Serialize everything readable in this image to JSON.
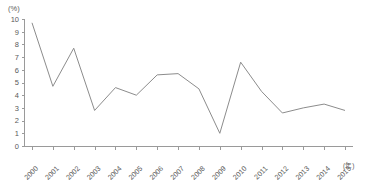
{
  "chart_data": {
    "type": "line",
    "title": "",
    "subtitle": "",
    "xlabel": "(年)",
    "ylabel": "(%)",
    "categories": [
      "2000",
      "2001",
      "2002",
      "2003",
      "2004",
      "2005",
      "2006",
      "2007",
      "2008",
      "2009",
      "2010",
      "2011",
      "2012",
      "2013",
      "2014",
      "2015"
    ],
    "x": [
      2000,
      2001,
      2002,
      2003,
      2004,
      2005,
      2006,
      2007,
      2008,
      2009,
      2010,
      2011,
      2012,
      2013,
      2014,
      2015
    ],
    "values": [
      9.7,
      4.7,
      7.7,
      2.8,
      4.6,
      4.0,
      5.6,
      5.7,
      4.5,
      1.0,
      6.6,
      4.3,
      2.6,
      3.0,
      3.3,
      2.8
    ],
    "series": [
      {
        "name": "",
        "values": [
          9.7,
          4.7,
          7.7,
          2.8,
          4.6,
          4.0,
          5.6,
          5.7,
          4.5,
          1.0,
          6.6,
          4.3,
          2.6,
          3.0,
          3.3,
          2.8
        ]
      }
    ],
    "ylim": [
      0,
      10
    ],
    "yticks": [
      0,
      1,
      2,
      3,
      4,
      5,
      6,
      7,
      8,
      9,
      10
    ],
    "ytick_labels": [
      "0",
      "1",
      "2",
      "3",
      "4",
      "5",
      "6",
      "7",
      "8",
      "9",
      "10"
    ],
    "xtick_labels": [
      "2000",
      "2001",
      "2002",
      "2003",
      "2004",
      "2005",
      "2006",
      "2007",
      "2008",
      "2009",
      "2010",
      "2011",
      "2012",
      "2013",
      "2014",
      "2015"
    ],
    "grid": false,
    "legend": "none",
    "line_color": "#8c8c8c",
    "axis_color": "#9a9a9a",
    "text_color": "#5a5a5a",
    "background_color": "#ffffff"
  }
}
